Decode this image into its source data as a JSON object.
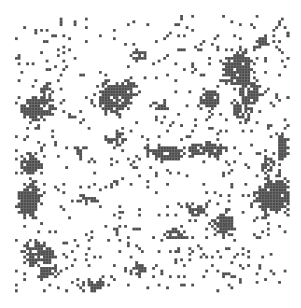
{
  "figure": {
    "colors": {
      "occupied": "#4a4a4a",
      "empty": "#ffffff",
      "gridline": "#e8e8e8"
    },
    "grid": {
      "origin_x": 15,
      "origin_y": 15,
      "cell": 2.8,
      "cols": 98,
      "rows": 99
    },
    "background_density": 0.06,
    "clusters": [
      {
        "cx": 114,
        "cy": 98,
        "rx": 16,
        "ry": 14,
        "d": 0.92
      },
      {
        "cx": 128,
        "cy": 90,
        "rx": 8,
        "ry": 10,
        "d": 0.85
      },
      {
        "cx": 38,
        "cy": 108,
        "rx": 14,
        "ry": 10,
        "d": 0.88
      },
      {
        "cx": 46,
        "cy": 95,
        "rx": 6,
        "ry": 10,
        "d": 0.7
      },
      {
        "cx": 30,
        "cy": 200,
        "rx": 9,
        "ry": 16,
        "d": 0.92
      },
      {
        "cx": 30,
        "cy": 165,
        "rx": 10,
        "ry": 10,
        "d": 0.88
      },
      {
        "cx": 238,
        "cy": 70,
        "rx": 13,
        "ry": 16,
        "d": 0.9
      },
      {
        "cx": 250,
        "cy": 92,
        "rx": 10,
        "ry": 14,
        "d": 0.85
      },
      {
        "cx": 242,
        "cy": 110,
        "rx": 10,
        "ry": 10,
        "d": 0.8
      },
      {
        "cx": 210,
        "cy": 100,
        "rx": 10,
        "ry": 9,
        "d": 0.75
      },
      {
        "cx": 205,
        "cy": 150,
        "rx": 18,
        "ry": 6,
        "d": 0.9
      },
      {
        "cx": 168,
        "cy": 153,
        "rx": 16,
        "ry": 7,
        "d": 0.9
      },
      {
        "cx": 275,
        "cy": 195,
        "rx": 16,
        "ry": 16,
        "d": 0.9
      },
      {
        "cx": 268,
        "cy": 165,
        "rx": 6,
        "ry": 8,
        "d": 0.75
      },
      {
        "cx": 283,
        "cy": 148,
        "rx": 5,
        "ry": 12,
        "d": 0.85
      },
      {
        "cx": 195,
        "cy": 210,
        "rx": 10,
        "ry": 6,
        "d": 0.8
      },
      {
        "cx": 223,
        "cy": 225,
        "rx": 10,
        "ry": 10,
        "d": 0.85
      },
      {
        "cx": 175,
        "cy": 235,
        "rx": 12,
        "ry": 5,
        "d": 0.75
      },
      {
        "cx": 40,
        "cy": 255,
        "rx": 14,
        "ry": 10,
        "d": 0.85
      },
      {
        "cx": 50,
        "cy": 272,
        "rx": 10,
        "ry": 6,
        "d": 0.8
      },
      {
        "cx": 30,
        "cy": 250,
        "rx": 8,
        "ry": 5,
        "d": 0.8
      },
      {
        "cx": 118,
        "cy": 140,
        "rx": 8,
        "ry": 5,
        "d": 0.8
      },
      {
        "cx": 95,
        "cy": 285,
        "rx": 10,
        "ry": 5,
        "d": 0.8
      },
      {
        "cx": 120,
        "cy": 230,
        "rx": 6,
        "ry": 4,
        "d": 0.8
      },
      {
        "cx": 80,
        "cy": 150,
        "rx": 5,
        "ry": 5,
        "d": 0.6
      },
      {
        "cx": 140,
        "cy": 55,
        "rx": 8,
        "ry": 6,
        "d": 0.6
      },
      {
        "cx": 160,
        "cy": 110,
        "rx": 6,
        "ry": 10,
        "d": 0.5
      },
      {
        "cx": 262,
        "cy": 42,
        "rx": 5,
        "ry": 6,
        "d": 0.7
      },
      {
        "cx": 140,
        "cy": 270,
        "rx": 6,
        "ry": 6,
        "d": 0.7
      },
      {
        "cx": 228,
        "cy": 275,
        "rx": 6,
        "ry": 3,
        "d": 0.6
      },
      {
        "cx": 88,
        "cy": 200,
        "rx": 10,
        "ry": 3,
        "d": 0.6
      },
      {
        "cx": 120,
        "cy": 180,
        "rx": 5,
        "ry": 3,
        "d": 0.7
      }
    ]
  }
}
